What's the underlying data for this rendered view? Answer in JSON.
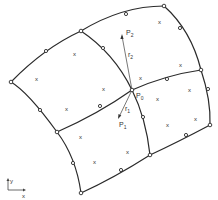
{
  "diagram": {
    "type": "finite-element-mesh",
    "labels": {
      "p0": "P",
      "p0_sub": "0",
      "p1": "P",
      "p1_sub": "1",
      "p2": "P",
      "p2_sub": "2",
      "r1": "r",
      "r1_sub": "1",
      "r2": "r",
      "r2_sub": "2",
      "axis_x": "x",
      "axis_y": "y"
    },
    "gauss_point_marker": "x",
    "corner_nodes": [
      [
        11,
        82
      ],
      [
        81,
        31
      ],
      [
        164,
        6
      ],
      [
        201,
        70
      ],
      [
        210,
        125
      ],
      [
        150,
        155
      ],
      [
        81,
        193
      ],
      [
        57,
        132
      ],
      [
        132,
        90
      ]
    ],
    "mid_nodes": [
      [
        46,
        51
      ],
      [
        126,
        14
      ],
      [
        180,
        28
      ],
      [
        103,
        48
      ],
      [
        167,
        79
      ],
      [
        208,
        89
      ],
      [
        186,
        135
      ],
      [
        143,
        117
      ],
      [
        121,
        170
      ],
      [
        73,
        163
      ],
      [
        40,
        110
      ],
      [
        100,
        106
      ]
    ],
    "gauss_points": [
      [
        37,
        79
      ],
      [
        75,
        53
      ],
      [
        104,
        89
      ],
      [
        67,
        109
      ],
      [
        160,
        22
      ],
      [
        181,
        65
      ],
      [
        141,
        78
      ],
      [
        190,
        90
      ],
      [
        158,
        99
      ],
      [
        168,
        125
      ],
      [
        196,
        119
      ],
      [
        81,
        137
      ],
      [
        95,
        176
      ],
      [
        128,
        152
      ]
    ],
    "colors": {
      "line": "#2a2a2a",
      "background": "#ffffff"
    }
  }
}
